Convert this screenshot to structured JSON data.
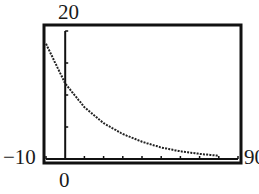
{
  "chart_data": {
    "type": "line",
    "title": "",
    "xlabel": "",
    "ylabel": "",
    "xlim": [
      -10,
      90
    ],
    "ylim": [
      0,
      20
    ],
    "grid": false,
    "legend": null,
    "x_ticks_every": 10,
    "y_ticks_every": 5,
    "window_labels": {
      "ymax": "20",
      "xmin": "-10",
      "xmax": "90",
      "origin": "0"
    },
    "series": [
      {
        "name": "decay curve",
        "style": "dotted",
        "x": [
          -10,
          0,
          10,
          20,
          30,
          40,
          50,
          60,
          70,
          80
        ],
        "y": [
          18.0,
          11.8,
          8.1,
          5.6,
          3.9,
          2.7,
          1.8,
          1.2,
          0.8,
          0.5
        ]
      }
    ]
  },
  "labels": {
    "ymax": "20",
    "xmin": "−10",
    "xmax": "90",
    "origin": "0"
  },
  "style": {
    "ink": "#111111",
    "background": "#ffffff"
  }
}
